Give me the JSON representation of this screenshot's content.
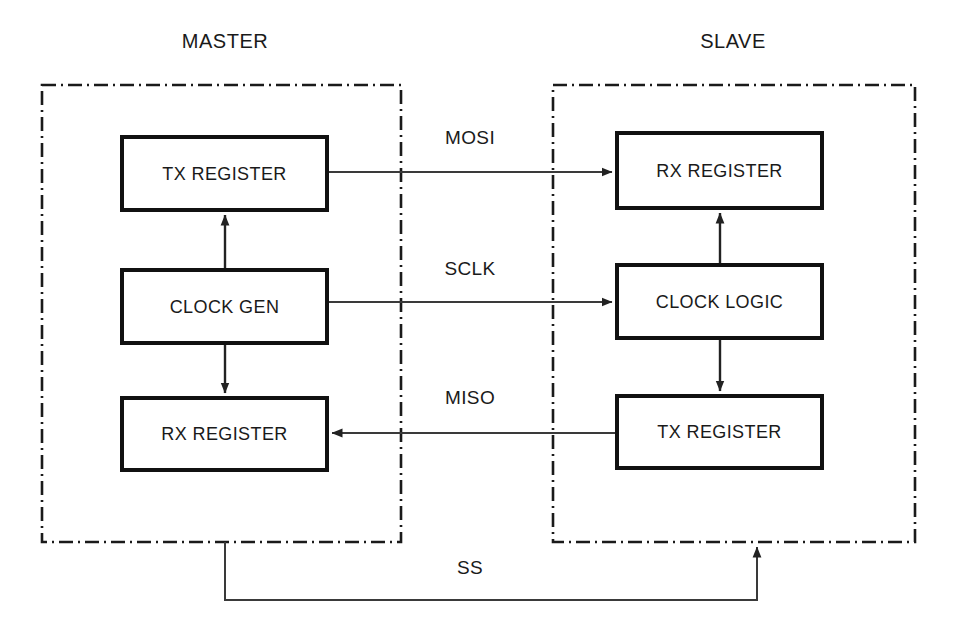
{
  "diagram": {
    "title_master": "MASTER",
    "title_slave": "SLAVE",
    "master": {
      "blocks": [
        {
          "id": "master-tx-register",
          "label": "TX REGISTER"
        },
        {
          "id": "master-clock-gen",
          "label": "CLOCK GEN"
        },
        {
          "id": "master-rx-register",
          "label": "RX REGISTER"
        }
      ]
    },
    "slave": {
      "blocks": [
        {
          "id": "slave-rx-register",
          "label": "RX REGISTER"
        },
        {
          "id": "slave-clock-logic",
          "label": "CLOCK LOGIC"
        },
        {
          "id": "slave-tx-register",
          "label": "TX REGISTER"
        }
      ]
    },
    "signals": [
      {
        "id": "mosi",
        "label": "MOSI",
        "direction": "master-to-slave"
      },
      {
        "id": "sclk",
        "label": "SCLK",
        "direction": "master-to-slave"
      },
      {
        "id": "miso",
        "label": "MISO",
        "direction": "slave-to-master"
      },
      {
        "id": "ss",
        "label": "SS",
        "direction": "master-to-slave"
      }
    ],
    "colors": {
      "background": "#ffffff",
      "block_stroke": "#111111",
      "wire": "#3a3a3a",
      "domain_stroke": "#1a1a1a",
      "text": "#1a1a1a"
    }
  }
}
